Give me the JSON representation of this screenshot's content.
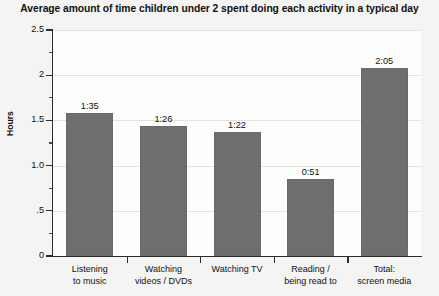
{
  "chart_data": {
    "type": "bar",
    "title": "Average amount of time children under 2 spent doing each activity in a typical day",
    "xlabel": "",
    "ylabel": "Hours",
    "ylim": [
      0,
      2.5
    ],
    "grid": true,
    "legend": "none",
    "categories": [
      "Listening\nto music",
      "Watching\nvideos / DVDs",
      "Watching TV",
      "Reading /\nbeing read to",
      "Total:\nscreen media"
    ],
    "values": [
      1.5833,
      1.4333,
      1.3667,
      0.85,
      2.0833
    ],
    "data_labels": [
      "1:35",
      "1:26",
      "1:22",
      "0:51",
      "2:05"
    ],
    "ytick_labels": [
      "0",
      ".5",
      "1.0",
      "1.5",
      "2",
      "2.5"
    ],
    "ytick_values": [
      0,
      0.5,
      1.0,
      1.5,
      2.0,
      2.5
    ],
    "yminor_values": [
      0.25,
      0.75,
      1.25,
      1.75,
      2.25
    ],
    "colors": {
      "bar": "#6e6e6e",
      "axis": "#2b2b2b",
      "grid": "#e2e2e0",
      "plot_background": "#fdfdfc",
      "page_background": "#f4f4f2",
      "text": "#111111"
    }
  }
}
